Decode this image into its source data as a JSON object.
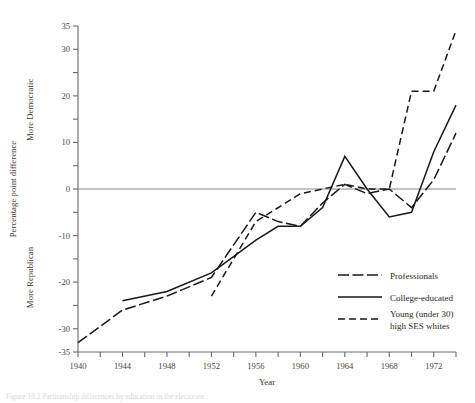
{
  "chart_data": {
    "type": "line",
    "title": "",
    "xlabel": "Year",
    "ylabel": "Percentage point difference",
    "ylabel_top": "More Democratic",
    "ylabel_bottom": "More Republican",
    "xlim": [
      1940,
      1974
    ],
    "ylim": [
      -35,
      35
    ],
    "yticks": [
      -35,
      -30,
      -25,
      -20,
      -15,
      -10,
      -5,
      0,
      5,
      10,
      15,
      20,
      25,
      30,
      35
    ],
    "ytick_labels": [
      "-35",
      "-30",
      "",
      "-20",
      "",
      "-10",
      "",
      "0",
      "",
      "10",
      "",
      "20",
      "",
      "30",
      "35"
    ],
    "xticks": [
      1940,
      1942,
      1944,
      1946,
      1948,
      1950,
      1952,
      1954,
      1956,
      1958,
      1960,
      1962,
      1964,
      1966,
      1968,
      1970,
      1972,
      1974
    ],
    "xtick_labels": [
      "1940",
      "",
      "1944",
      "",
      "1948",
      "",
      "1952",
      "",
      "1956",
      "",
      "1960",
      "",
      "1964",
      "",
      "1968",
      "",
      "1972",
      ""
    ],
    "grid": false,
    "zero_reference_line": 0,
    "legend_position": "bottom-right",
    "series": [
      {
        "name": "Professionals",
        "style": "dash-dot",
        "x": [
          1940,
          1944,
          1948,
          1952,
          1956,
          1958,
          1960,
          1962,
          1964,
          1966,
          1968,
          1970,
          1972,
          1974
        ],
        "values": [
          -33,
          -26,
          -23,
          -19,
          -5,
          -7,
          -8,
          -3,
          1,
          -1,
          0,
          -4,
          2,
          12
        ]
      },
      {
        "name": "College-educated",
        "style": "solid",
        "x": [
          1944,
          1948,
          1952,
          1956,
          1958,
          1960,
          1962,
          1964,
          1966,
          1968,
          1970,
          1972,
          1974
        ],
        "values": [
          -24,
          -22,
          -18,
          -11,
          -8,
          -8,
          -4,
          7,
          0,
          -6,
          -5,
          8,
          18
        ]
      },
      {
        "name": "Young (under 30) high SES whites",
        "style": "dashed",
        "x": [
          1952,
          1956,
          1960,
          1964,
          1966,
          1968,
          1970,
          1972,
          1974
        ],
        "values": [
          -23,
          -7,
          -1,
          1,
          0,
          0,
          21,
          21,
          34
        ]
      }
    ]
  },
  "legend": {
    "items": [
      {
        "label": "Professionals",
        "style": "dash-dot"
      },
      {
        "label": "College-educated",
        "style": "solid"
      },
      {
        "label_line1": "Young (under 30)",
        "label_line2": "high SES whites",
        "style": "dashed"
      }
    ]
  },
  "caption": {
    "text": "Figure 10.2  Partisanship differences by education in the electorate"
  }
}
